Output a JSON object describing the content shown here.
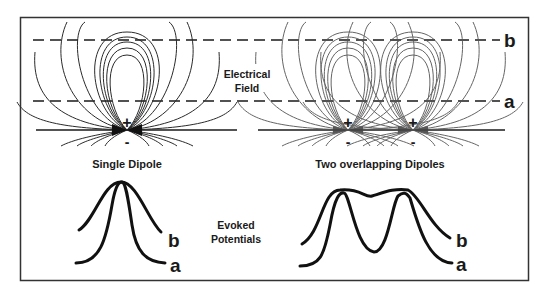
{
  "figure": {
    "labels": {
      "electrical_field_line1": "Electrical",
      "electrical_field_line2": "Field",
      "level_b": "b",
      "level_a": "a",
      "plus": "+",
      "minus": "-",
      "single_dipole_title": "Single Dipole",
      "two_dipoles_title": "Two overlapping Dipoles",
      "evoked_line1": "Evoked",
      "evoked_line2": "Potentials",
      "curve_b": "b",
      "curve_a": "a"
    },
    "colors": {
      "ink": "#1a1a1a",
      "field_lines": "#2a2a2a",
      "field_lines_overlap": "#555555",
      "frame": "#333333",
      "background": "#ffffff"
    }
  }
}
